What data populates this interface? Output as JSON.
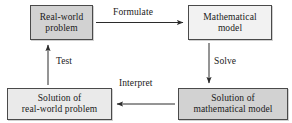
{
  "diagram": {
    "colors": {
      "box_fill_dark": "#d2d2d2",
      "box_fill_light": "#f2f2f2",
      "box_fill_mid": "#eaeaea",
      "border": "#4a4a4a",
      "text": "#1a1a1a",
      "background": "#ffffff",
      "arrow": "#2b2b2b"
    },
    "nodes": [
      {
        "id": "real-world-problem",
        "lines": [
          "Real-world",
          "problem"
        ],
        "fill": "#d2d2d2"
      },
      {
        "id": "mathematical-model",
        "lines": [
          "Mathematical",
          "model"
        ],
        "fill": "#f2f2f2"
      },
      {
        "id": "solution-of-real-world-problem",
        "lines": [
          "Solution of",
          "real-world problem"
        ],
        "fill": "#eaeaea"
      },
      {
        "id": "solution-of-mathematical-model",
        "lines": [
          "Solution of",
          "mathematical model"
        ],
        "fill": "#d2d2d2"
      }
    ],
    "edges": [
      {
        "id": "formulate",
        "label": "Formulate",
        "from": "real-world-problem",
        "to": "mathematical-model",
        "direction": "right"
      },
      {
        "id": "solve",
        "label": "Solve",
        "from": "mathematical-model",
        "to": "solution-of-mathematical-model",
        "direction": "down"
      },
      {
        "id": "interpret",
        "label": "Interpret",
        "from": "solution-of-mathematical-model",
        "to": "solution-of-real-world-problem",
        "direction": "left"
      },
      {
        "id": "test",
        "label": "Test",
        "from": "solution-of-real-world-problem",
        "to": "real-world-problem",
        "direction": "up"
      }
    ]
  }
}
